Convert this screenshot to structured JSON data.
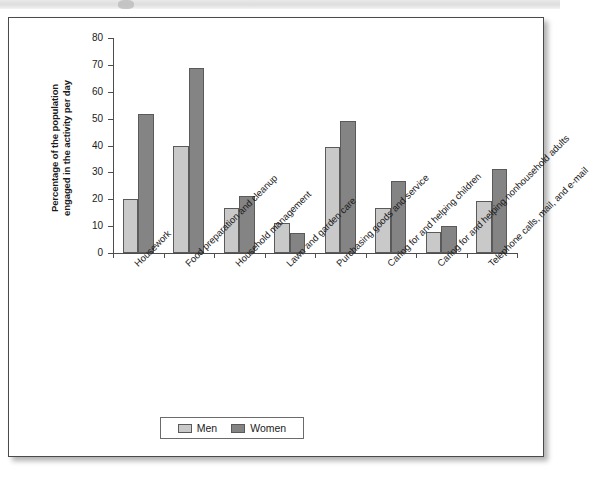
{
  "figure": {
    "legend": {
      "entries": [
        {
          "label": "Men",
          "color": "#c9c9c9"
        },
        {
          "label": "Women",
          "color": "#848484"
        }
      ]
    }
  },
  "chart_data": {
    "type": "bar",
    "title": "",
    "subtitle": "",
    "xlabel": "",
    "ylabel": "Percentage of the population engaged in the activity per day",
    "ylabel_lines": [
      "Percentage of the population",
      "engaged in the activity per day"
    ],
    "ylim": [
      0,
      80
    ],
    "yticks": [
      0,
      10,
      20,
      30,
      40,
      50,
      60,
      70,
      80
    ],
    "ytick_labels": [
      "0",
      "10",
      "20",
      "30",
      "40",
      "50",
      "60",
      "70",
      "80"
    ],
    "grid": false,
    "legend_position": "bottom-center",
    "categories": [
      "Housework",
      "Food preparation and cleanup",
      "Household management",
      "Lawn and garden care",
      "Purchasing goods and service",
      "Caring for and helping children",
      "Caring for and helping nonhousehold adults",
      "Telephone calls, mail, and e-mail"
    ],
    "series": [
      {
        "name": "Men",
        "color": "#c9c9c9",
        "values": [
          20,
          40,
          16.7,
          11.3,
          39.5,
          16.7,
          8,
          19.5
        ]
      },
      {
        "name": "Women",
        "color": "#848484",
        "values": [
          51.7,
          68.8,
          21.3,
          7.3,
          49.2,
          26.7,
          9.9,
          31.4
        ]
      }
    ]
  }
}
